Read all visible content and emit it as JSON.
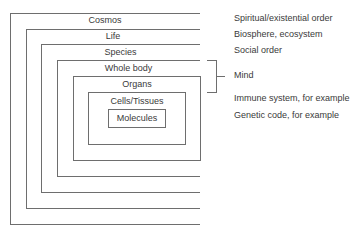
{
  "diagram": {
    "levels": [
      {
        "label": "Cosmos"
      },
      {
        "label": "Life"
      },
      {
        "label": "Species"
      },
      {
        "label": "Whole body"
      },
      {
        "label": "Organs"
      },
      {
        "label": "Cells/Tissues"
      },
      {
        "label": "Molecules"
      }
    ],
    "annotations": [
      {
        "text": "Spiritual/existential order"
      },
      {
        "text": "Biosphere, ecosystem"
      },
      {
        "text": "Social order"
      },
      {
        "text": "Mind"
      },
      {
        "text": "Immune system, for example"
      },
      {
        "text": "Genetic code, for example"
      }
    ],
    "colors": {
      "line": "#6e6e6e",
      "text": "#3a3a3a"
    }
  }
}
